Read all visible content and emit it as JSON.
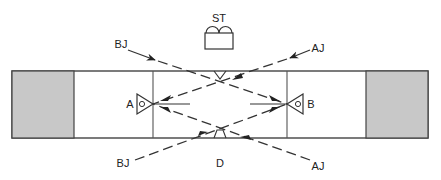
{
  "diagram": {
    "labels": {
      "st": "ST",
      "device_a": "A",
      "device_b": "B",
      "bj_top": "BJ",
      "aj_top": "AJ",
      "bj_bottom": "BJ",
      "aj_bottom": "AJ",
      "d": "D"
    },
    "colors": {
      "line": "#333333",
      "block_fill": "#c8c8c8",
      "background": "#ffffff"
    },
    "elements": [
      {
        "id": "left-block",
        "type": "shaded-block"
      },
      {
        "id": "right-block",
        "type": "shaded-block"
      },
      {
        "id": "st-unit",
        "type": "source"
      },
      {
        "id": "device-a",
        "type": "detector"
      },
      {
        "id": "device-b",
        "type": "detector"
      },
      {
        "id": "top-crossing",
        "type": "reflector"
      },
      {
        "id": "bottom-crossing",
        "type": "reflector"
      }
    ],
    "beams": [
      {
        "from": "BJ (top-left)",
        "to": "top-crossing",
        "style": "dashed"
      },
      {
        "from": "AJ (top-right)",
        "to": "device-a",
        "style": "dashed"
      },
      {
        "from": "BJ (bottom-left)",
        "to": "device-b",
        "style": "dashed"
      },
      {
        "from": "AJ (bottom-right)",
        "to": "bottom-crossing",
        "style": "dashed"
      }
    ]
  }
}
